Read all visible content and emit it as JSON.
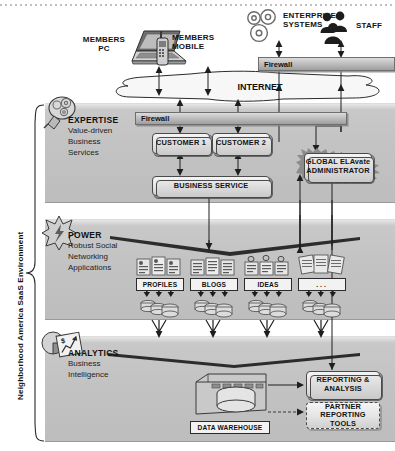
{
  "diagram": {
    "title": "Neighborhood America SaaS Environment",
    "vertical_label": "Neighborhood America SaaS Environment",
    "type": "architecture-diagram"
  },
  "external": {
    "members_pc": "MEMBERS\nPC",
    "members_mobile": "MEMBERS\nMOBILE",
    "enterprise_systems": "ENTERPRISE\nSYSTEMS",
    "staff": "STAFF",
    "internet": "INTERNET",
    "firewall_top": "Firewall"
  },
  "sections": [
    {
      "id": "expertise",
      "title": "EXPERTISE",
      "subtitle": "Value-driven\nBusiness\nServices",
      "icon": "lightbulb-gears-icon",
      "firewall": "Firewall",
      "nodes": [
        {
          "id": "customer-1",
          "label": "CUSTOMER 1"
        },
        {
          "id": "customer-2",
          "label": "CUSTOMER 2"
        },
        {
          "id": "business-service",
          "label": "BUSINESS SERVICE"
        },
        {
          "id": "global-elavate-administrator",
          "label": "GLOBAL ELAvate\nADMINISTRATOR"
        }
      ]
    },
    {
      "id": "power",
      "title": "POWER",
      "subtitle": "Robust Social\nNetworking\nApplications",
      "icon": "starburst-power-icon",
      "apps": [
        {
          "id": "profiles",
          "label": "PROFILES"
        },
        {
          "id": "blogs",
          "label": "BLOGS"
        },
        {
          "id": "ideas",
          "label": "IDEAS"
        },
        {
          "id": "more",
          "label": "..."
        }
      ]
    },
    {
      "id": "analytics",
      "title": "ANALYTICS",
      "subtitle": "Business\nIntelligence",
      "icon": "pie-chart-report-icon",
      "nodes": [
        {
          "id": "data-warehouse",
          "label": "DATA WAREHOUSE"
        },
        {
          "id": "reporting-analysis",
          "label": "REPORTING &\nANALYSIS"
        },
        {
          "id": "partner-reporting-tools",
          "label": "PARTNER\nREPORTING TOOLS"
        }
      ]
    }
  ],
  "colors": {
    "band": "#c4c4c4",
    "node_fill": "#e8e8e8",
    "line": "#1e1e1e",
    "text": "#131313"
  }
}
